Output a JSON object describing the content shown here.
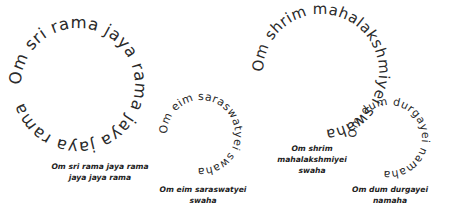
{
  "mantras": [
    {
      "ring_text": "Om sri rama jaya rama jaya jaya rama",
      "caption_lines": [
        "Om sri rama jaya rama",
        "jaya jaya rama"
      ],
      "circle": {
        "cx": 78,
        "cy": 85,
        "r": 57,
        "font_size": 16.5,
        "start_offset": "0%"
      }
    },
    {
      "ring_text": "Om eim saraswatyei swaha",
      "caption_lines": [
        "Om eim saraswatyei",
        "swaha"
      ],
      "circle": {
        "cx": 201,
        "cy": 134,
        "r": 34,
        "font_size": 11,
        "start_offset": "0%"
      }
    },
    {
      "ring_text": "Om shrim mahalakshmiyei swaha",
      "caption_lines": [
        "Om shrim",
        "mahalakshmiyei",
        "swaha"
      ],
      "circle": {
        "cx": 321,
        "cy": 72,
        "r": 58,
        "font_size": 15,
        "start_offset": "0%"
      }
    },
    {
      "ring_text": "Om dum durgayei namaha",
      "caption_lines": [
        "Om dum durgayei",
        "namaha"
      ],
      "circle": {
        "cx": 389,
        "cy": 138,
        "r": 33,
        "font_size": 11,
        "start_offset": "0%"
      }
    }
  ],
  "colors": {
    "text": "#2a2a2a",
    "background": "#ffffff"
  }
}
